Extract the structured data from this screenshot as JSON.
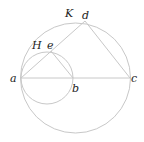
{
  "diagram": {
    "type": "geometry",
    "labels": {
      "a": "a",
      "b": "b",
      "c": "c",
      "d": "d",
      "e": "e",
      "H": "H",
      "K": "K"
    },
    "points": {
      "a": [
        21,
        78
      ],
      "b": [
        73,
        78
      ],
      "c": [
        130,
        78
      ],
      "d": [
        85,
        21
      ],
      "e": [
        51,
        51
      ]
    },
    "circles": [
      {
        "name": "big-circle",
        "center": [
          75.5,
          78
        ],
        "r": 55
      },
      {
        "name": "small-circle",
        "center": [
          47,
          78
        ],
        "r": 26
      }
    ],
    "segments": [
      [
        "a",
        "c"
      ],
      [
        "a",
        "d"
      ],
      [
        "d",
        "c"
      ],
      [
        "e",
        "b"
      ]
    ],
    "line_color": "#c8c8c8"
  }
}
